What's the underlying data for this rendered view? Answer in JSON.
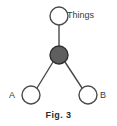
{
  "figure": {
    "caption": "Fig. 3",
    "background_color": "#ffffff",
    "stroke_color": "#4a4a4a",
    "filled_node_color": "#5f5f5f",
    "open_node_fill": "#ffffff",
    "label_color": "#3a3a3a"
  },
  "diagram": {
    "type": "node-link-graph",
    "nodes": [
      {
        "id": "things",
        "label": "Things",
        "style": "open-circle",
        "cx": 59,
        "cy": 16,
        "r": 9,
        "label_position": "right"
      },
      {
        "id": "center",
        "label": "",
        "style": "filled-circle",
        "cx": 59,
        "cy": 55,
        "r": 9,
        "label_position": "none"
      },
      {
        "id": "a",
        "label": "A",
        "style": "open-circle",
        "cx": 31,
        "cy": 95,
        "r": 9,
        "label_position": "left"
      },
      {
        "id": "b",
        "label": "B",
        "style": "open-circle",
        "cx": 88,
        "cy": 95,
        "r": 9,
        "label_position": "right"
      }
    ],
    "edges": [
      {
        "from": "center",
        "to": "things"
      },
      {
        "from": "center",
        "to": "a"
      },
      {
        "from": "center",
        "to": "b"
      }
    ]
  }
}
